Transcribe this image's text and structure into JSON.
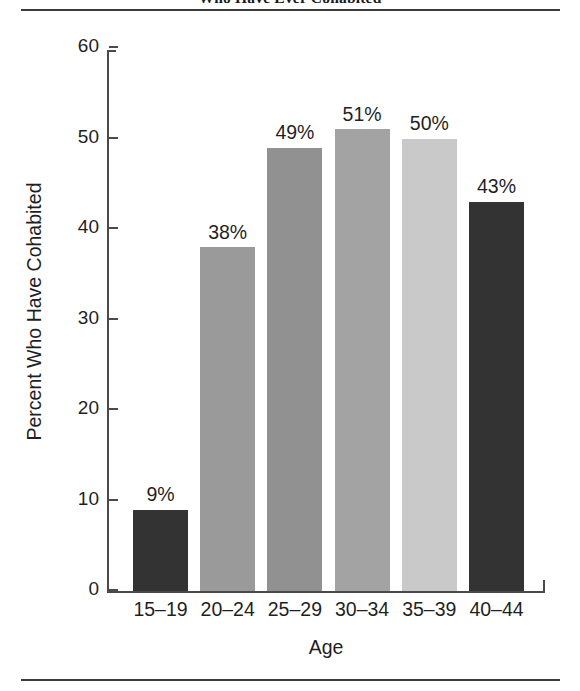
{
  "figure": {
    "title": "Who Have Ever Cohabited"
  },
  "chart_data": {
    "type": "bar",
    "title": "Who Have Ever Cohabited",
    "xlabel": "Age",
    "ylabel": "Percent Who Have Cohabited",
    "categories": [
      "15–19",
      "20–24",
      "25–29",
      "30–34",
      "35–39",
      "40–44"
    ],
    "values": [
      9,
      38,
      49,
      51,
      50,
      43
    ],
    "value_labels": [
      "9%",
      "38%",
      "49%",
      "51%",
      "50%",
      "43%"
    ],
    "bar_colors": [
      "#333333",
      "#9a9a9a",
      "#919191",
      "#a3a3a3",
      "#c9c9c9",
      "#333333"
    ],
    "ylim": [
      0,
      60
    ],
    "yticks": [
      0,
      10,
      20,
      30,
      40,
      50,
      60
    ],
    "ytick_labels": [
      "0",
      "10",
      "20",
      "30",
      "40",
      "50",
      "60"
    ],
    "grid": false,
    "legend": null
  }
}
